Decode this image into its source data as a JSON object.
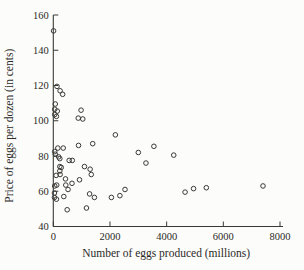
{
  "figure": {
    "background_color": "#fcfcfa",
    "ink_color": "#3a3935",
    "marker": "open-circle"
  },
  "chart_data": {
    "type": "scatter",
    "title": "",
    "xlabel": "Number of eggs produced (millions)",
    "ylabel": "Price of eggs per dozen (in cents)",
    "xlim": [
      0,
      8200
    ],
    "ylim": [
      40,
      160
    ],
    "x_ticks": [
      0,
      2000,
      4000,
      6000,
      8000
    ],
    "y_ticks": [
      40,
      60,
      80,
      100,
      120,
      140,
      160
    ],
    "grid": false,
    "legend": null,
    "points": [
      [
        10,
        151
      ],
      [
        130,
        119.5
      ],
      [
        240,
        117
      ],
      [
        330,
        115
      ],
      [
        70,
        109.5
      ],
      [
        50,
        106.5
      ],
      [
        140,
        105.5
      ],
      [
        50,
        103.5
      ],
      [
        110,
        102.5
      ],
      [
        980,
        106
      ],
      [
        880,
        101.5
      ],
      [
        1040,
        101
      ],
      [
        2190,
        92
      ],
      [
        160,
        84.5
      ],
      [
        350,
        84.5
      ],
      [
        890,
        86
      ],
      [
        1390,
        87
      ],
      [
        3550,
        85.5
      ],
      [
        50,
        82.5
      ],
      [
        70,
        81
      ],
      [
        190,
        79.5
      ],
      [
        3000,
        82
      ],
      [
        4250,
        80.5
      ],
      [
        230,
        78.5
      ],
      [
        560,
        77.5
      ],
      [
        670,
        77.5
      ],
      [
        3270,
        76
      ],
      [
        230,
        74
      ],
      [
        280,
        73.5
      ],
      [
        1100,
        74
      ],
      [
        1300,
        72.5
      ],
      [
        230,
        71.5
      ],
      [
        100,
        69
      ],
      [
        240,
        69.5
      ],
      [
        1340,
        69.5
      ],
      [
        430,
        67
      ],
      [
        925,
        66.5
      ],
      [
        50,
        63
      ],
      [
        120,
        63.5
      ],
      [
        440,
        63.5
      ],
      [
        660,
        64.5
      ],
      [
        520,
        61
      ],
      [
        2530,
        61
      ],
      [
        40,
        59
      ],
      [
        40,
        56.5
      ],
      [
        110,
        55.5
      ],
      [
        370,
        57
      ],
      [
        1280,
        58.5
      ],
      [
        1450,
        56.5
      ],
      [
        2050,
        56.5
      ],
      [
        2350,
        57.5
      ],
      [
        490,
        49.5
      ],
      [
        1170,
        50.5
      ],
      [
        4650,
        59.5
      ],
      [
        4950,
        61.5
      ],
      [
        5400,
        62
      ],
      [
        7400,
        63
      ]
    ]
  }
}
